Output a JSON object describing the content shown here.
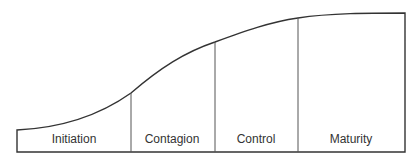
{
  "diagram": {
    "type": "s-curve stage model",
    "stages": [
      {
        "label": "Initiation"
      },
      {
        "label": "Contagion"
      },
      {
        "label": "Control"
      },
      {
        "label": "Maturity"
      }
    ],
    "colors": {
      "line": "#333333",
      "text": "#333333",
      "background": "#ffffff"
    }
  }
}
